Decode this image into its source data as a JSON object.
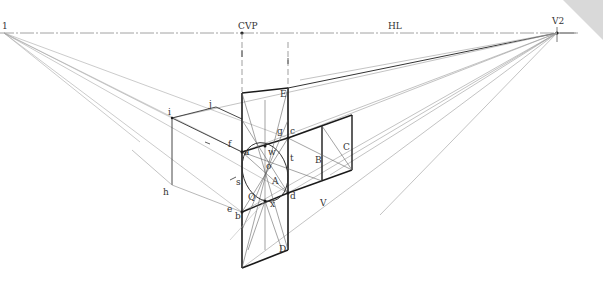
{
  "diagram": {
    "type": "two-point perspective construction",
    "horizon_label": "HL",
    "points": {
      "vp_left": {
        "label": "1",
        "x": 4,
        "y": 33
      },
      "cvp": {
        "label": "CVP",
        "x": 242,
        "y": 33
      },
      "vp_right": {
        "label": "V2",
        "x": 557,
        "y": 33
      }
    },
    "labels": [
      {
        "id": "vp1",
        "text": "1",
        "x": 2,
        "y": 22
      },
      {
        "id": "cvp",
        "text": "CVP",
        "x": 238,
        "y": 22
      },
      {
        "id": "hl",
        "text": "HL",
        "x": 388,
        "y": 22
      },
      {
        "id": "v2",
        "text": "V2",
        "x": 552,
        "y": 17
      },
      {
        "id": "E",
        "text": "E",
        "x": 280,
        "y": 90
      },
      {
        "id": "i",
        "text": "i",
        "x": 168,
        "y": 108
      },
      {
        "id": "j",
        "text": "j",
        "x": 209,
        "y": 100
      },
      {
        "id": "f",
        "text": "f",
        "x": 228,
        "y": 140
      },
      {
        "id": "g",
        "text": "g",
        "x": 277,
        "y": 127
      },
      {
        "id": "c",
        "text": "c",
        "x": 290,
        "y": 127
      },
      {
        "id": "a",
        "text": "a",
        "x": 244,
        "y": 148
      },
      {
        "id": "w",
        "text": "w",
        "x": 268,
        "y": 148
      },
      {
        "id": "t",
        "text": "t",
        "x": 290,
        "y": 154
      },
      {
        "id": "o",
        "text": "o",
        "x": 266,
        "y": 162
      },
      {
        "id": "B",
        "text": "B",
        "x": 315,
        "y": 156
      },
      {
        "id": "C",
        "text": "C",
        "x": 343,
        "y": 143
      },
      {
        "id": "A",
        "text": "A",
        "x": 272,
        "y": 177
      },
      {
        "id": "s",
        "text": "s",
        "x": 236,
        "y": 178
      },
      {
        "id": "h",
        "text": "h",
        "x": 163,
        "y": 188
      },
      {
        "id": "Q",
        "text": "Q",
        "x": 248,
        "y": 193
      },
      {
        "id": "d",
        "text": "d",
        "x": 290,
        "y": 192
      },
      {
        "id": "x",
        "text": "x",
        "x": 270,
        "y": 200
      },
      {
        "id": "e",
        "text": "e",
        "x": 227,
        "y": 205
      },
      {
        "id": "b",
        "text": "b",
        "x": 235,
        "y": 212
      },
      {
        "id": "D",
        "text": "D",
        "x": 279,
        "y": 245
      },
      {
        "id": "V",
        "text": "V",
        "x": 320,
        "y": 199
      }
    ],
    "colors": {
      "heavy_line": "#1a1a1a",
      "construction_line": "#9a9a9a",
      "light_line": "#c4c4c4",
      "label": "#333333",
      "corner_fold": "#d9d9d9"
    }
  }
}
